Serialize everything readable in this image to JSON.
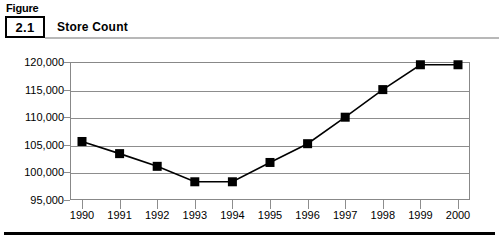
{
  "figure": {
    "label": "Figure",
    "number": "2.1",
    "title": "Store Count"
  },
  "chart_data": {
    "type": "line",
    "title": "Store Count",
    "xlabel": "",
    "ylabel": "",
    "categories": [
      "1990",
      "1991",
      "1992",
      "1993",
      "1994",
      "1995",
      "1996",
      "1997",
      "1998",
      "1999",
      "2000"
    ],
    "values": [
      105600,
      103400,
      101100,
      98300,
      98300,
      101800,
      105200,
      110000,
      115000,
      119500,
      119500
    ],
    "ylim": [
      95000,
      120000
    ],
    "ytick_labels": [
      "120,000",
      "115,000",
      "110,000",
      "105,000",
      "100,000",
      "95,000"
    ],
    "ytick_values": [
      120000,
      115000,
      110000,
      105000,
      100000,
      95000
    ],
    "grid": true,
    "legend": "none",
    "marker": "square",
    "marker_color": "#000000",
    "line_color": "#000000",
    "grid_color": "#8d8d8d"
  }
}
